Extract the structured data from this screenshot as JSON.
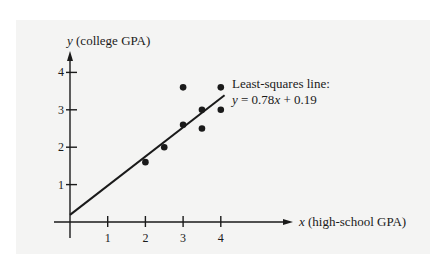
{
  "chart_data": {
    "type": "scatter",
    "title": "",
    "xlabel": "x (high-school GPA)",
    "ylabel": "y (college GPA)",
    "x_axis_var": "x",
    "x_axis_desc": "(high-school GPA)",
    "y_axis_var": "y",
    "y_axis_desc": "(college GPA)",
    "xlim": [
      0,
      5.9
    ],
    "ylim": [
      0,
      4.5
    ],
    "x_ticks": [
      1,
      2,
      3,
      4
    ],
    "x_tick_labels": [
      "1",
      "2",
      "3",
      "4"
    ],
    "y_ticks": [
      1,
      2,
      3,
      4
    ],
    "y_tick_labels": [
      "1",
      "2",
      "3",
      "4"
    ],
    "grid": false,
    "legend": null,
    "series": [
      {
        "name": "Data points",
        "type": "scatter",
        "points": [
          {
            "x": 2.0,
            "y": 1.6
          },
          {
            "x": 2.5,
            "y": 2.0
          },
          {
            "x": 3.0,
            "y": 2.6
          },
          {
            "x": 3.0,
            "y": 3.6
          },
          {
            "x": 3.5,
            "y": 2.5
          },
          {
            "x": 3.5,
            "y": 3.0
          },
          {
            "x": 4.0,
            "y": 3.0
          },
          {
            "x": 4.0,
            "y": 3.6
          }
        ]
      },
      {
        "name": "Least-squares line",
        "type": "line",
        "slope": 0.78,
        "intercept": 0.19,
        "x_range": [
          0,
          4.1
        ]
      }
    ],
    "annotations": [
      {
        "text": "Least-squares line:",
        "position": "right of line end"
      },
      {
        "text": "y = 0.78x + 0.19",
        "position": "below annotation title"
      }
    ]
  },
  "annotation": {
    "title": "Least-squares line:",
    "eq_y": "y",
    "eq_equals": " = 0.78",
    "eq_x": "x",
    "eq_rest": " + 0.19"
  },
  "colors": {
    "panel": "#f4f4f3",
    "ink": "#1a1a1a"
  }
}
